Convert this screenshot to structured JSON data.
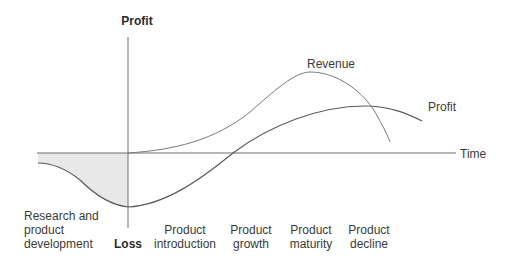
{
  "diagram": {
    "type": "product-life-cycle",
    "y_axis": {
      "top_label": "Profit",
      "bottom_label": "Loss"
    },
    "x_axis": {
      "label": "Time"
    },
    "curves": [
      {
        "name": "Revenue",
        "label": "Revenue"
      },
      {
        "name": "Profit",
        "label": "Profit"
      }
    ],
    "stages": [
      {
        "lines": [
          "Research and",
          "product",
          "development"
        ]
      },
      {
        "lines": [
          "Product",
          "introduction"
        ]
      },
      {
        "lines": [
          "Product",
          "growth"
        ]
      },
      {
        "lines": [
          "Product",
          "maturity"
        ]
      },
      {
        "lines": [
          "Product",
          "decline"
        ]
      }
    ],
    "colors": {
      "line": "#6e6e6e",
      "shade": "#e8e8e8",
      "text": "#3a3a3a"
    }
  }
}
